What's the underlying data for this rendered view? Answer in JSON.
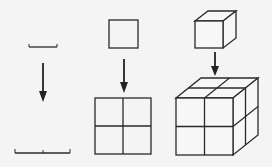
{
  "diagram": {
    "background": "#f4f4f4",
    "line_color": "#2a2a2a",
    "columns": [
      {
        "id": "1d",
        "top_shape": "line-segment",
        "bottom_shape": "line-segment-doubled",
        "bottom_parts": 2
      },
      {
        "id": "2d",
        "top_shape": "square",
        "bottom_shape": "square-2x2",
        "bottom_parts": 4
      },
      {
        "id": "3d",
        "top_shape": "cube",
        "bottom_shape": "cube-2x2x2",
        "bottom_parts": 8
      }
    ],
    "arrows": [
      {
        "name": "down-arrow",
        "direction": "down"
      },
      {
        "name": "down-arrow",
        "direction": "down"
      },
      {
        "name": "down-arrow",
        "direction": "down"
      }
    ]
  }
}
